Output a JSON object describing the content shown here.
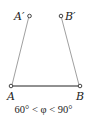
{
  "diagram": {
    "points": {
      "A_prime": {
        "label": "A′"
      },
      "B_prime": {
        "label": "B′"
      },
      "A": {
        "label": "A"
      },
      "B": {
        "label": "B"
      }
    },
    "caption": "60° < φ < 90°",
    "colors": {
      "base_line": "#222222",
      "arm_line": "#999999",
      "point": "#444444"
    }
  }
}
